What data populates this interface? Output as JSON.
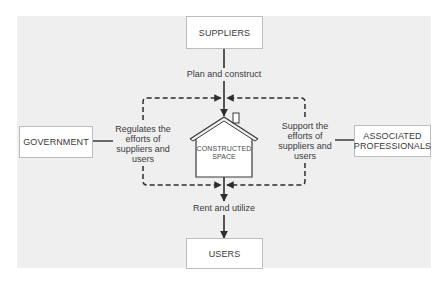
{
  "diagram": {
    "nodes": {
      "suppliers": "SUPPLIERS",
      "users": "USERS",
      "government": "GOVERNMENT",
      "associated_line1": "ASSOCIATED",
      "associated_line2": "PROFESSIONALS",
      "center_line1": "CONSTRUCTED",
      "center_line2": "SPACE"
    },
    "edges": {
      "top": "Plan and construct",
      "bottom": "Rent and utilize",
      "left": [
        "Regulates the",
        "efforts of",
        "suppliers and",
        "users"
      ],
      "right": [
        "Support the",
        "efforts of",
        "suppliers and",
        "users"
      ]
    },
    "colors": {
      "background_panel": "#efefef",
      "box_fill": "#ffffff",
      "box_border": "#bdbdbd",
      "line": "#2e2e2e"
    }
  }
}
